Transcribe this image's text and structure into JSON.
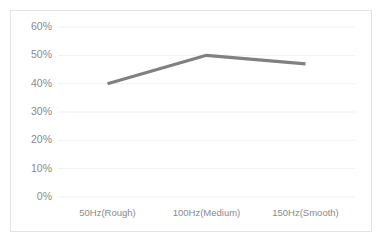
{
  "chart_data": {
    "type": "line",
    "title": "",
    "subtitle": "",
    "xlabel": "",
    "ylabel": "",
    "categories": [
      "50Hz(Rough)",
      "100Hz(Medium)",
      "150Hz(Smooth)"
    ],
    "values": [
      40,
      50,
      47
    ],
    "series": [
      {
        "name": "",
        "values": [
          40,
          50,
          47
        ]
      }
    ],
    "ylim": [
      0,
      60
    ],
    "ytick_values": [
      0,
      10,
      20,
      30,
      40,
      50,
      60
    ],
    "ytick_labels": [
      "0%",
      "10%",
      "20%",
      "30%",
      "40%",
      "50%",
      "60%"
    ],
    "value_format": "percent",
    "grid": true,
    "grid_axis": "y",
    "legend": false,
    "legend_position": "none",
    "line_color": "#808080",
    "grid_color": "#f0f0f0",
    "border_color": "#e3e3e3",
    "tick_label_color": "#8a8a8a",
    "background_color": "#ffffff"
  }
}
